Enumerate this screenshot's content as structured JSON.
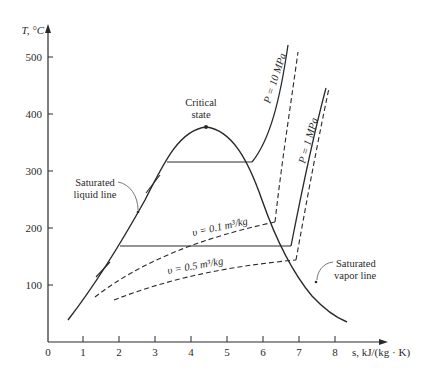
{
  "diagram": {
    "type": "T-s diagram",
    "y_axis": {
      "label": "T, °C",
      "ticks": [
        "100",
        "200",
        "300",
        "400",
        "500"
      ]
    },
    "x_axis": {
      "label": "s, kJ/(kg · K)",
      "ticks": [
        "0",
        "1",
        "2",
        "3",
        "4",
        "5",
        "6",
        "7",
        "8"
      ]
    },
    "annotations": {
      "critical_line1": "Critical",
      "critical_line2": "state",
      "sat_liquid_line1": "Saturated",
      "sat_liquid_line2": "liquid line",
      "sat_vapor_line1": "Saturated",
      "sat_vapor_line2": "vapor line",
      "p_high": "P = 10 MPa",
      "p_low": "P = 1 MPa",
      "v_small": "υ = 0.1 m³/kg",
      "v_large": "υ = 0.5 m³/kg"
    },
    "curves": [
      {
        "name": "saturation dome",
        "style": "solid"
      },
      {
        "name": "P = 10 MPa isobar",
        "style": "solid"
      },
      {
        "name": "P = 1 MPa isobar",
        "style": "solid"
      },
      {
        "name": "υ = 0.1 m³/kg isochore",
        "style": "dashed"
      },
      {
        "name": "υ = 0.5 m³/kg isochore",
        "style": "dashed"
      }
    ],
    "colors": {
      "ink": "#2a2a2a",
      "background": "#ffffff"
    }
  }
}
